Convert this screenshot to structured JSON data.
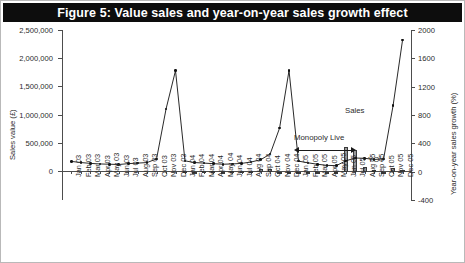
{
  "title": "Figure 5: Value sales and year-on-year sales growth effect",
  "annotations": {
    "sales_label": "Sales",
    "yoy_label": "YOY",
    "monopoly_label": "Monopoly Live"
  },
  "chart_data": {
    "type": "bar",
    "title": "Figure 5: Value sales and year-on-year sales growth effect",
    "xlabel": "",
    "ylabel": "Sales value (£)",
    "y2label": "Year-on-year sales growth (%)",
    "ylim": [
      0,
      2500000
    ],
    "y2lim": [
      -400,
      2000
    ],
    "yticks": [
      "0",
      "500,000",
      "1,000,000",
      "1,500,000",
      "2,000,000",
      "2,500,000"
    ],
    "ytick_values": [
      0,
      500000,
      1000000,
      1500000,
      2000000,
      2500000
    ],
    "y2ticks": [
      "-400",
      "0",
      "400",
      "800",
      "1200",
      "1600",
      "2000"
    ],
    "y2tick_values": [
      -400,
      0,
      400,
      800,
      1200,
      1600,
      2000
    ],
    "grid": false,
    "legend_position": "inline-annotations",
    "categories": [
      "Jan 03",
      "Feb 03",
      "Mar 03",
      "Apr 03",
      "May 03",
      "Jun 03",
      "Jul 03",
      "Aug 03",
      "Sep 03",
      "Oct 03",
      "Nov 03",
      "Dec 03",
      "Jan 04",
      "Feb 04",
      "Mar 04",
      "Apr 04",
      "May 04",
      "Jun 04",
      "Jul 04",
      "Aug 04",
      "Sep 04",
      "Oct 04",
      "Nov 04",
      "Dec 04",
      "Jan 05",
      "Feb 05",
      "Mar 05",
      "Apr 05",
      "May 05",
      "Jun 05",
      "Jul 05",
      "Aug 05",
      "Sep 05",
      "Oct 05",
      "Nov 05",
      "Dec 05"
    ],
    "series": [
      {
        "name": "Sales",
        "type": "line",
        "axis": "left",
        "unit": "£",
        "values": [
          170000,
          150000,
          135000,
          125000,
          120000,
          115000,
          130000,
          140000,
          150000,
          215000,
          1100000,
          1780000,
          180000,
          150000,
          140000,
          130000,
          120000,
          125000,
          135000,
          160000,
          200000,
          300000,
          760000,
          1780000,
          175000,
          145000,
          120000,
          100000,
          95000,
          180000,
          230000,
          225000,
          205000,
          215000,
          1160000,
          2320000
        ]
      },
      {
        "name": "YOY",
        "type": "bar",
        "axis": "right",
        "unit": "%",
        "values": [
          null,
          null,
          null,
          null,
          null,
          null,
          null,
          null,
          null,
          null,
          null,
          null,
          8,
          0,
          5,
          4,
          0,
          10,
          6,
          15,
          33,
          40,
          -30,
          0,
          -3,
          -3,
          -14,
          -23,
          -21,
          345,
          300,
          62,
          30,
          -28,
          53,
          30
        ]
      }
    ],
    "notes": [
      {
        "text": "Monopoly Live",
        "type": "range-annotation",
        "start": "Jun 05",
        "end": "Oct 05"
      },
      {
        "text": "Sales",
        "type": "series-label"
      },
      {
        "text": "YOY",
        "type": "series-label"
      }
    ]
  },
  "colors": {
    "title_bar_bg": "#0d0d0d",
    "title_text": "#ffffff",
    "bar_fill": "#9a9a9a",
    "bar_stroke": "#3a3a3a",
    "line": "#111111",
    "axis": "#4d4d4d",
    "background": "#ffffff"
  }
}
